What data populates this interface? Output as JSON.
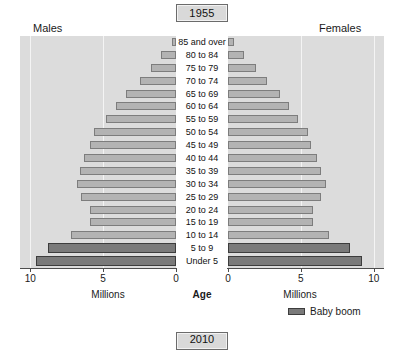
{
  "title": {
    "year": "1955",
    "next_year": "2010"
  },
  "headers": {
    "males": "Males",
    "females": "Females"
  },
  "axis": {
    "left_title": "Millions",
    "right_title": "Millions",
    "center_title": "Age",
    "left_ticks": [
      "10",
      "5",
      "0"
    ],
    "right_ticks": [
      "0",
      "5",
      "10"
    ]
  },
  "legend": {
    "label": "Baby boom",
    "color": "#7a7a7a"
  },
  "colors": {
    "plot_background": "#dcdcdc",
    "bar_fill": "#b3b3b3",
    "bar_border": "#7d7d7d",
    "boom_fill": "#7a7a7a",
    "boom_border": "#3d3d3d",
    "gridline": "#f4f4f4",
    "center_band": "#ffffff",
    "title_box": "#d9d9d9"
  },
  "chart_data": {
    "type": "bar",
    "title": "1955",
    "subtitle": "United States population pyramid",
    "xlabel": "Millions",
    "ylabel": "Age",
    "xlim": [
      0,
      10.5
    ],
    "grid": true,
    "legend_position": "bottom-right",
    "orientation": "horizontal-diverging",
    "categories": [
      "85 and over",
      "80 to 84",
      "75 to 79",
      "70 to 74",
      "65 to 69",
      "60 to 64",
      "55 to 59",
      "50 to 54",
      "45 to 49",
      "40 to 44",
      "35 to 39",
      "30 to 34",
      "25 to 29",
      "20 to 24",
      "15 to 19",
      "10 to 14",
      "5 to 9",
      "Under 5"
    ],
    "series": [
      {
        "name": "Males",
        "side": "left",
        "values": [
          0.3,
          1.0,
          1.7,
          2.5,
          3.4,
          4.1,
          4.8,
          5.6,
          5.9,
          6.3,
          6.6,
          6.8,
          6.5,
          5.9,
          5.9,
          7.2,
          8.8,
          9.6
        ]
      },
      {
        "name": "Females",
        "side": "right",
        "values": [
          0.4,
          1.1,
          1.9,
          2.7,
          3.6,
          4.2,
          4.8,
          5.5,
          5.7,
          6.1,
          6.4,
          6.7,
          6.4,
          5.8,
          5.8,
          6.9,
          8.4,
          9.2
        ]
      }
    ],
    "highlight": {
      "label": "Baby boom",
      "categories": [
        "5 to 9",
        "Under 5"
      ]
    }
  }
}
